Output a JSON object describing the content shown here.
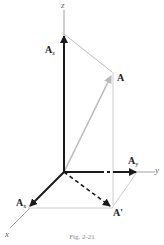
{
  "axes": {
    "x": "x",
    "y": "y",
    "z": "z"
  },
  "vectors": {
    "A": {
      "label": "A"
    },
    "Ax": {
      "label": "A",
      "sub": "x"
    },
    "Ay": {
      "label": "A",
      "sub": "y"
    },
    "Az": {
      "label": "A",
      "sub": "z"
    },
    "Aprime": {
      "label": "A'"
    }
  },
  "caption": "Fig. 2-21",
  "colors": {
    "dark": "#1a1a1a",
    "light": "#bbbbbb",
    "axis": "#888888"
  }
}
